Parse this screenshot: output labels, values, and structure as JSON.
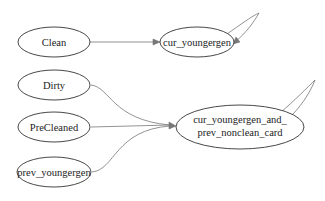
{
  "diagram": {
    "type": "directed-graph",
    "nodes": [
      {
        "id": "clean",
        "label": "Clean"
      },
      {
        "id": "cur_youngergen",
        "label": "cur_youngergen"
      },
      {
        "id": "dirty",
        "label": "Dirty"
      },
      {
        "id": "precleaned",
        "label": "PreCleaned"
      },
      {
        "id": "prev_youngergen",
        "label": "prev_youngergen"
      },
      {
        "id": "cur_and_prev",
        "label_line1": "cur_youngergen_and_",
        "label_line2": "prev_nonclean_card"
      }
    ],
    "edges": [
      {
        "from": "Clean",
        "to": "cur_youngergen"
      },
      {
        "from": "cur_youngergen",
        "to": "cur_youngergen"
      },
      {
        "from": "Dirty",
        "to": "cur_youngergen_and_prev_nonclean_card"
      },
      {
        "from": "PreCleaned",
        "to": "cur_youngergen_and_prev_nonclean_card"
      },
      {
        "from": "prev_youngergen",
        "to": "cur_youngergen_and_prev_nonclean_card"
      },
      {
        "from": "cur_youngergen_and_prev_nonclean_card",
        "to": "cur_youngergen_and_prev_nonclean_card"
      }
    ]
  }
}
